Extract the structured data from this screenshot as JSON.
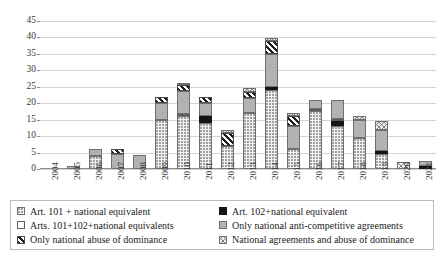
{
  "chart_data": {
    "type": "bar",
    "subtype": "stacked-bar",
    "title": "",
    "xlabel": "",
    "ylabel": "",
    "ylim": [
      0,
      45
    ],
    "ytick_step": 5,
    "yticks": [
      "0",
      "5",
      "10",
      "15",
      "20",
      "25",
      "30",
      "35",
      "40",
      "45"
    ],
    "grid": true,
    "legend_position": "bottom",
    "categories": [
      "2004",
      "2005",
      "2006",
      "2007",
      "2008",
      "2009",
      "2010",
      "2011",
      "2012",
      "2013",
      "2014",
      "2015",
      "2016",
      "2017",
      "2018",
      "2019",
      "2020",
      "2021"
    ],
    "series": [
      {
        "name": "Art. 101 + national equivalent",
        "key": "art101",
        "pattern": "p-dots",
        "values": [
          0,
          0,
          4,
          0,
          0,
          15,
          16,
          14,
          7,
          17,
          24,
          6,
          17.5,
          13,
          9.5,
          4.5,
          0,
          0
        ]
      },
      {
        "name": "Art. 102+national equivalent",
        "key": "art102",
        "pattern": "p-black",
        "values": [
          0,
          0,
          0,
          0,
          0,
          0,
          0,
          2,
          0,
          0,
          1,
          0,
          0,
          1.5,
          0,
          1,
          0,
          1
        ]
      },
      {
        "name": "Arts. 101+102+national equivalents",
        "key": "art101_102",
        "pattern": "p-white",
        "values": [
          0,
          0,
          0,
          0,
          0,
          0,
          0.5,
          0,
          0,
          0,
          0,
          0,
          0.5,
          0.5,
          0,
          0,
          0,
          0
        ]
      },
      {
        "name": "Only national anti-competitive agreements",
        "key": "nat_agreements",
        "pattern": "p-gray",
        "values": [
          0,
          1,
          2,
          4.5,
          4.2,
          5,
          7,
          4,
          0,
          4.5,
          10,
          7,
          3,
          6,
          5.5,
          6.5,
          0,
          1.5
        ]
      },
      {
        "name": "Only national abuse of dominance",
        "key": "nat_abuse",
        "pattern": "p-hatch",
        "values": [
          0,
          0,
          0,
          1.5,
          0,
          2,
          2,
          2,
          4,
          2,
          4,
          3,
          0,
          0,
          0,
          0,
          0,
          0
        ]
      },
      {
        "name": "National agreements  and abuse of dominance",
        "key": "nat_both",
        "pattern": "p-cross",
        "values": [
          0,
          0,
          0,
          0,
          0,
          0,
          0.5,
          0,
          1,
          1,
          1,
          1,
          0,
          0,
          1,
          2.5,
          2,
          0
        ]
      }
    ],
    "totals": [
      0,
      1,
      6,
      6,
      4.2,
      22,
      26,
      22,
      12,
      24.5,
      40,
      17,
      21,
      21,
      16,
      14.5,
      2,
      2.5
    ]
  },
  "legend": {
    "items": [
      {
        "label": "Art. 101 + national equivalent",
        "pattern": "p-dots"
      },
      {
        "label": "Art. 102+national equivalent",
        "pattern": "p-black"
      },
      {
        "label": "Arts. 101+102+national equivalents",
        "pattern": "p-white"
      },
      {
        "label": "Only national anti-competitive agreements",
        "pattern": "p-gray"
      },
      {
        "label": "Only national abuse of dominance",
        "pattern": "p-hatch"
      },
      {
        "label": "National agreements  and abuse of dominance",
        "pattern": "p-cross"
      }
    ],
    "column_order": [
      0,
      1,
      2,
      3,
      4,
      5
    ]
  }
}
